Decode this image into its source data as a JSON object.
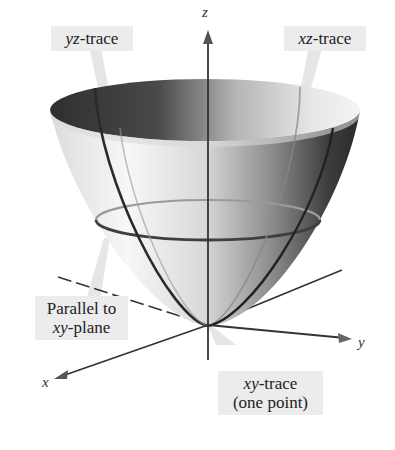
{
  "figure": {
    "surface": "paraboloid",
    "axes": {
      "x": {
        "label": "x"
      },
      "y": {
        "label": "y"
      },
      "z": {
        "label": "z"
      }
    },
    "callouts": [
      {
        "id": "yz",
        "italic": "yz",
        "text": "-trace"
      },
      {
        "id": "xz",
        "italic": "xz",
        "text": "-trace"
      },
      {
        "id": "parallel",
        "line1": "Parallel to",
        "italic": "xy",
        "text": "-plane"
      },
      {
        "id": "xy",
        "italic": "xy",
        "text": "-trace",
        "line2": "(one point)"
      }
    ],
    "colors": {
      "background": "#ffffff",
      "callout_fill": "#ececec",
      "axis": "#333333",
      "surface_dark": "#3a3a3a",
      "surface_light": "#f2f2f2",
      "trace_line": "#555555"
    }
  }
}
